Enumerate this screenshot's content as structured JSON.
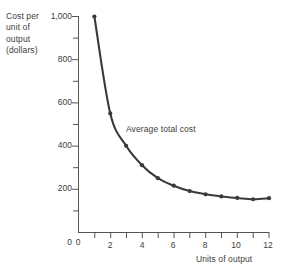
{
  "chart_data": {
    "type": "line",
    "title": "",
    "xlabel": "Units of output",
    "ylabel": "Cost per unit of output (dollars)",
    "ylabel_lines": [
      "Cost per",
      "unit of",
      "output",
      "(dollars)"
    ],
    "series": [
      {
        "name": "Average total cost",
        "x": [
          1,
          2,
          3,
          4,
          5,
          6,
          7,
          8,
          9,
          10,
          11,
          12
        ],
        "values": [
          1000,
          550,
          400,
          310,
          250,
          215,
          190,
          175,
          165,
          158,
          152,
          157
        ]
      }
    ],
    "annotations": [
      {
        "text": "Average total cost",
        "x": 3.1,
        "y": 455
      }
    ],
    "xlim": [
      0,
      12
    ],
    "ylim": [
      0,
      1000
    ],
    "x_ticks": [
      0,
      1,
      2,
      3,
      4,
      5,
      6,
      7,
      8,
      9,
      10,
      11,
      12
    ],
    "x_tick_labels": [
      "0",
      "",
      "2",
      "",
      "4",
      "",
      "6",
      "",
      "8",
      "",
      "10",
      "",
      "12"
    ],
    "y_ticks": [
      0,
      100,
      200,
      300,
      400,
      500,
      600,
      700,
      800,
      900,
      1000
    ],
    "y_tick_labels": [
      "0",
      "",
      "200",
      "",
      "400",
      "",
      "600",
      "",
      "800",
      "",
      "1,000"
    ],
    "grid": false,
    "legend": "none",
    "line_color": "#3a3a3a",
    "marker": "circle",
    "axis_color": "#555555",
    "background": "#ffffff"
  },
  "axis": {
    "y_labels": [
      "1,000",
      "800",
      "600",
      "400",
      "200",
      "0"
    ],
    "x_labels": [
      "0",
      "2",
      "4",
      "6",
      "8",
      "10",
      "12"
    ]
  }
}
